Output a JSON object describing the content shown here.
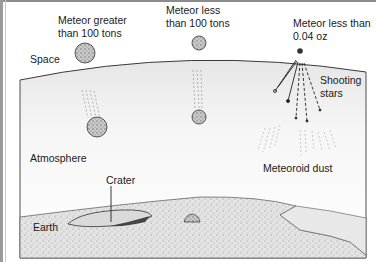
{
  "diagram": {
    "labels": {
      "space": "Space",
      "atmosphere": "Atmosphere",
      "earth": "Earth",
      "crater": "Crater",
      "meteor_large_line1": "Meteor greater",
      "meteor_large_line2": "than 100 tons",
      "meteor_medium_line1": "Meteor less",
      "meteor_medium_line2": "than 100 tons",
      "meteor_small_line1": "Meteor less than",
      "meteor_small_line2": "0.04 oz",
      "shooting_stars_line1": "Shooting",
      "shooting_stars_line2": "stars",
      "meteoroid_dust": "Meteoroid dust"
    },
    "colors": {
      "outline": "#3a3a3a",
      "atmosphere_shade": "#ececec",
      "rock": "#bdbdbd",
      "earth": "#d9d9d9"
    }
  }
}
